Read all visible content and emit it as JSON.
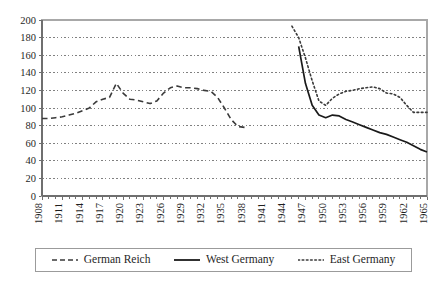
{
  "chart_data": {
    "type": "line",
    "title": "",
    "subtitle": "",
    "xlabel": "",
    "ylabel": "",
    "xlim": [
      1908,
      1965
    ],
    "ylim": [
      0,
      200
    ],
    "ytick_step": 20,
    "yticks": [
      0,
      20,
      40,
      60,
      80,
      100,
      120,
      140,
      160,
      180,
      200
    ],
    "ytick_labels": [
      "0",
      "20",
      "40",
      "60",
      "80",
      "100",
      "120",
      "140",
      "160",
      "180",
      "200"
    ],
    "xticks_every": 1,
    "xtick_label_every": 3,
    "xtick_labels": [
      "1908",
      "1911",
      "1914",
      "1917",
      "1920",
      "1923",
      "1926",
      "1929",
      "1932",
      "1935",
      "1938",
      "1941",
      "1944",
      "1947",
      "1950",
      "1953",
      "1956",
      "1959",
      "1962",
      "1965"
    ],
    "xtick_label_rotation": -90,
    "grid": {
      "horizontal": true,
      "vertical": false,
      "style": "dotted",
      "color": "#808080"
    },
    "legend": {
      "position": "bottom",
      "entries": [
        {
          "name": "German Reich",
          "style": "dashed",
          "color": "#3a3a3a"
        },
        {
          "name": "West Germany",
          "style": "solid",
          "color": "#1a1a1a"
        },
        {
          "name": "East Germany",
          "style": "dotted",
          "color": "#3a3a3a"
        }
      ]
    },
    "series": [
      {
        "name": "German Reich",
        "style": "dashed",
        "color": "#3a3a3a",
        "x": [
          1908,
          1909,
          1910,
          1911,
          1912,
          1913,
          1914,
          1915,
          1916,
          1917,
          1918,
          1919,
          1920,
          1921,
          1922,
          1923,
          1924,
          1925,
          1926,
          1927,
          1928,
          1929,
          1930,
          1931,
          1932,
          1933,
          1934,
          1935,
          1936,
          1937,
          1938
        ],
        "values": [
          88,
          88,
          89,
          90,
          92,
          94,
          97,
          100,
          107,
          110,
          112,
          128,
          117,
          110,
          109,
          107,
          105,
          108,
          117,
          123,
          125,
          123,
          123,
          122,
          120,
          119,
          112,
          100,
          87,
          79,
          78
        ]
      },
      {
        "name": "West Germany",
        "style": "solid",
        "color": "#1a1a1a",
        "x": [
          1946,
          1947,
          1948,
          1949,
          1950,
          1951,
          1952,
          1953,
          1954,
          1955,
          1956,
          1957,
          1958,
          1959,
          1960,
          1961,
          1962,
          1963,
          1964,
          1965
        ],
        "values": [
          170,
          128,
          103,
          92,
          89,
          92,
          91,
          87,
          84,
          81,
          78,
          75,
          72,
          70,
          67,
          64,
          61,
          57,
          53,
          50
        ]
      },
      {
        "name": "East Germany",
        "style": "dotted",
        "color": "#3a3a3a",
        "x": [
          1945,
          1946,
          1947,
          1948,
          1949,
          1950,
          1951,
          1952,
          1953,
          1954,
          1955,
          1956,
          1957,
          1958,
          1959,
          1960,
          1961,
          1962,
          1963,
          1964,
          1965
        ],
        "values": [
          193,
          180,
          157,
          131,
          108,
          103,
          111,
          116,
          119,
          120,
          122,
          123,
          124,
          122,
          117,
          116,
          112,
          103,
          95,
          95,
          95
        ]
      }
    ]
  }
}
